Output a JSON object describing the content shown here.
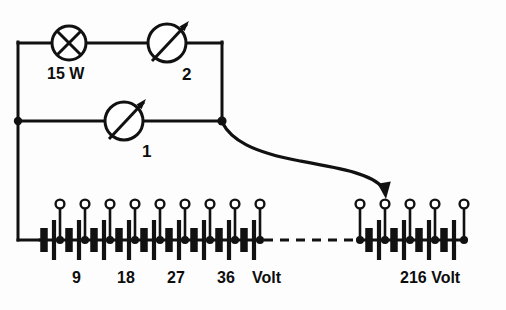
{
  "diagram": {
    "background_color": "#fdfdfd",
    "line_color": "#111111"
  },
  "components": {
    "lamp": {
      "icon": "lamp-circle-cross-icon",
      "label": "15 W",
      "cx": 69,
      "cy": 43,
      "r": 17
    },
    "meter_top": {
      "icon": "variable-meter-arrow-icon",
      "label": "2",
      "cx": 167,
      "cy": 43,
      "r": 19
    },
    "meter_bottom": {
      "icon": "variable-meter-arrow-icon",
      "label": "1",
      "cx": 124,
      "cy": 121,
      "r": 19
    }
  },
  "labels": {
    "lamp_power": "15 W",
    "meter_two": "2",
    "meter_one": "1",
    "scale_9": "9",
    "scale_18": "18",
    "scale_27": "27",
    "scale_36": "36",
    "unit_volt": "Volt",
    "max_voltage": "216 Volt"
  },
  "battery": {
    "left_group": {
      "cell_count": 9,
      "first_tap_x": 60,
      "pitch": 25,
      "baseline_y": 240,
      "tap_ring_y": 204
    },
    "right_group": {
      "cell_count": 5,
      "first_tap_x": 360,
      "pitch": 25,
      "baseline_y": 240,
      "tap_ring_y": 204
    },
    "dashed_gap": {
      "x_start": 262,
      "x_end": 360,
      "y": 240
    },
    "tap_labels": [
      {
        "text": "9",
        "x": 97,
        "y": 272
      },
      {
        "text": "18",
        "x": 139,
        "y": 272
      },
      {
        "text": "27",
        "x": 186,
        "y": 272
      },
      {
        "text": "36",
        "x": 232,
        "y": 272
      },
      {
        "text": "Volt",
        "x": 266,
        "y": 272
      },
      {
        "text": "216 Volt",
        "x": 412,
        "y": 272
      }
    ]
  },
  "connection": {
    "pointer_icon": "curved-arrow-icon",
    "from_x": 222,
    "from_y": 121,
    "to_x": 385,
    "to_y": 196
  },
  "wires": {
    "top_rail_y": 43,
    "mid_rail_y": 121,
    "left_x": 18,
    "right_x": 222,
    "bottom_y": 240
  }
}
